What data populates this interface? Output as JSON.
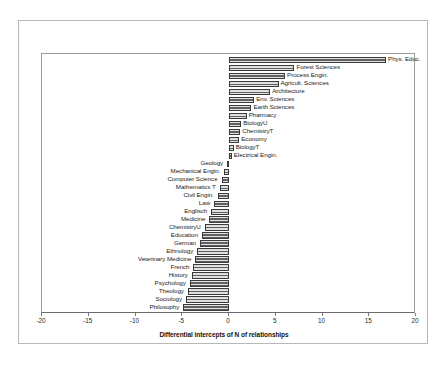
{
  "figure": {
    "xaxis_title": "Differential intercepts of N of relationships"
  },
  "chart_data": {
    "type": "bar",
    "orientation": "horizontal",
    "title": "",
    "xlabel": "Differential intercepts of N of relationships",
    "ylabel": "",
    "xlim": [
      -20,
      20
    ],
    "xticks": [
      -20,
      -15,
      -10,
      -5,
      0,
      5,
      10,
      15,
      20
    ],
    "xtick_labels": [
      "-20",
      "-15",
      "-10",
      "-5",
      "0",
      "5",
      "10",
      "15",
      "20"
    ],
    "grid": false,
    "legend": false,
    "bar_color": "#8d8d8d",
    "bar_edge_color": "#3a3a3a",
    "categories": [
      "Phys. Educ.",
      "Forest Sciences",
      "Process Engin.",
      "Agricult. Sciences",
      "Architecture",
      "Env. Sciences",
      "Earth Sciences",
      "Pharmacy",
      "BiologyU",
      "ChemistryT",
      "Economy",
      "BiologyT",
      "Electrical Engin.",
      "Geology",
      "Mechanical Engin.",
      "Computer Science",
      "Mathematics T",
      "Civil Engin.",
      "Law",
      "Englisch",
      "Medicine",
      "ChemistryU",
      "Education",
      "German",
      "Ethnology",
      "Veterinary Medicine",
      "French",
      "History",
      "Psychology",
      "Theology",
      "Sociology",
      "Philosophy"
    ],
    "values": [
      16.8,
      7.0,
      6.0,
      5.3,
      4.4,
      2.7,
      2.4,
      1.9,
      1.3,
      1.2,
      1.1,
      0.5,
      0.3,
      -0.2,
      -0.5,
      -0.8,
      -1.0,
      -1.2,
      -1.6,
      -1.9,
      -2.1,
      -2.6,
      -2.9,
      -3.1,
      -3.4,
      -3.6,
      -3.8,
      -4.0,
      -4.2,
      -4.4,
      -4.6,
      -4.9
    ]
  }
}
